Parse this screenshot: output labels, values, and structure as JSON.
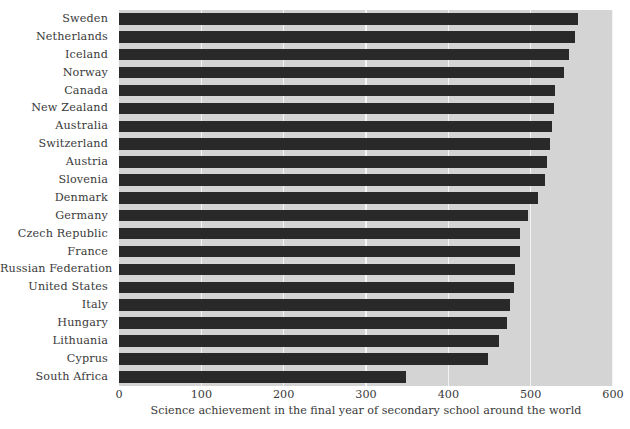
{
  "chart_data": {
    "type": "bar",
    "orientation": "horizontal",
    "title": "",
    "xlabel": "Science achievement in the final year of secondary school around the world",
    "ylabel": "",
    "xlim": [
      0,
      600
    ],
    "xticks": [
      0,
      100,
      200,
      300,
      400,
      500,
      600
    ],
    "xtick_labels": [
      "0",
      "100",
      "200",
      "300",
      "400",
      "500",
      "600"
    ],
    "grid": true,
    "grid_axis": "x",
    "legend": false,
    "categories": [
      "Sweden",
      "Netherlands",
      "Iceland",
      "Norway",
      "Canada",
      "New Zealand",
      "Australia",
      "Switzerland",
      "Austria",
      "Slovenia",
      "Denmark",
      "Germany",
      "Czech Republic",
      "France",
      "Russian Federation",
      "United States",
      "Italy",
      "Hungary",
      "Lithuania",
      "Cyprus",
      "South Africa"
    ],
    "values": [
      557,
      554,
      546,
      540,
      529,
      528,
      526,
      523,
      520,
      517,
      509,
      497,
      487,
      487,
      481,
      480,
      475,
      471,
      461,
      448,
      349
    ],
    "bar_color": "#292929",
    "plot_background": "#d4d4d4",
    "gridline_color": "#f4f4f4"
  },
  "caption": {
    "text": ""
  }
}
